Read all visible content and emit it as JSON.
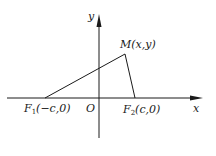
{
  "diagram": {
    "type": "coordinate-geometry",
    "colors": {
      "stroke": "#1a1a1a",
      "background": "#ffffff"
    },
    "axes": {
      "x_label": "x",
      "y_label": "y",
      "origin_label": "O"
    },
    "points": {
      "F1": {
        "name": "F",
        "sub": "1",
        "coords": "(−c,0)"
      },
      "F2": {
        "name": "F",
        "sub": "2",
        "coords": "(c,0)"
      },
      "M": {
        "name": "M",
        "coords": "(x,y)"
      }
    },
    "segments": [
      "F1-M",
      "M-F2"
    ]
  }
}
